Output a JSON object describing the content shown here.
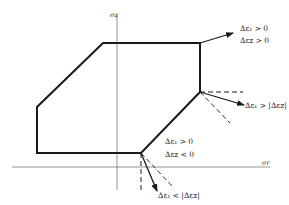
{
  "diagram": {
    "type": "yield surface with strain increment directions",
    "axes": {
      "vertical": {
        "label": "σz",
        "x": 117,
        "y_top": 15,
        "y_bottom": 190
      },
      "horizontal": {
        "label": "σr",
        "y": 167,
        "x_left": 12,
        "x_right": 270
      }
    },
    "polygon": {
      "points": "103,43 200,43 200,92 141,153 37,153 37,107",
      "stroke": "#1a1a1a",
      "stroke_width": 2
    },
    "annotations": [
      {
        "id": "top-right",
        "line1": "Δε₁ > 0",
        "line2": "Δεz > 0"
      },
      {
        "id": "right-corner",
        "line1": "Δε₁ > |Δεz|"
      },
      {
        "id": "lower-middle",
        "line1": "Δε₁ > 0",
        "line2": "Δεz < 0"
      },
      {
        "id": "bottom",
        "line1": "Δε₁ < |Δεz|"
      }
    ],
    "colors": {
      "line": "#1a1a1a",
      "axis": "#555555",
      "background": "#ffffff"
    }
  }
}
